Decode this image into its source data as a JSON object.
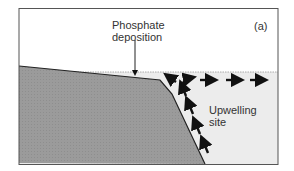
{
  "figure": {
    "panel_label": "(a)",
    "labels": {
      "phosphate_line1": "Phosphate",
      "phosphate_line2": "deposition",
      "upwelling_line1": "Upwelling",
      "upwelling_line2": "site"
    },
    "colors": {
      "land": "#9b9b9b",
      "water": "#ececec",
      "sky": "#ffffff",
      "outline": "#444444",
      "arrows": "#111111"
    }
  }
}
